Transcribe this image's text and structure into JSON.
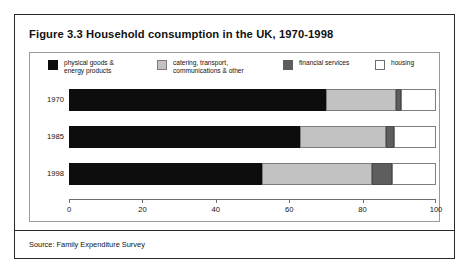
{
  "figure": {
    "title": "Figure 3.3 Household consumption in the UK, 1970-1998",
    "source": "Source: Family Expenditure Survey"
  },
  "colors": {
    "goods": "#0d0d0d",
    "catering": "#c2c2c2",
    "financial": "#5e5e5e",
    "housing": "#ffffff",
    "frame": "#9a9a9a",
    "border": "#2a2a2a",
    "text": "#111111"
  },
  "legend": {
    "items": [
      {
        "label": "physical goods &\nenergy products",
        "swatch": "goods"
      },
      {
        "label": "catering, transport,\ncommunications & other",
        "swatch": "catering"
      },
      {
        "label": "financial services",
        "swatch": "financial"
      },
      {
        "label": "housing",
        "swatch": "housing"
      }
    ]
  },
  "axis": {
    "ticks": [
      "0",
      "20",
      "40",
      "60",
      "80",
      "100"
    ],
    "min": 0,
    "max": 100
  },
  "chart_data": {
    "type": "bar",
    "orientation": "horizontal",
    "stacked": true,
    "title": "Figure 3.3 Household consumption in the UK, 1970-1998",
    "xlabel": "",
    "ylabel": "",
    "xlim": [
      0,
      100
    ],
    "grid": false,
    "legend_position": "top",
    "categories": [
      "1970",
      "1985",
      "1998"
    ],
    "series": [
      {
        "name": "physical goods & energy products",
        "values": [
          70,
          63,
          52.5
        ]
      },
      {
        "name": "catering, transport, communications & other",
        "values": [
          19,
          23.5,
          30
        ]
      },
      {
        "name": "financial services",
        "values": [
          1.5,
          2,
          5.5
        ]
      },
      {
        "name": "housing",
        "values": [
          9.5,
          11.5,
          12
        ]
      }
    ],
    "source": "Source: Family Expenditure Survey"
  }
}
